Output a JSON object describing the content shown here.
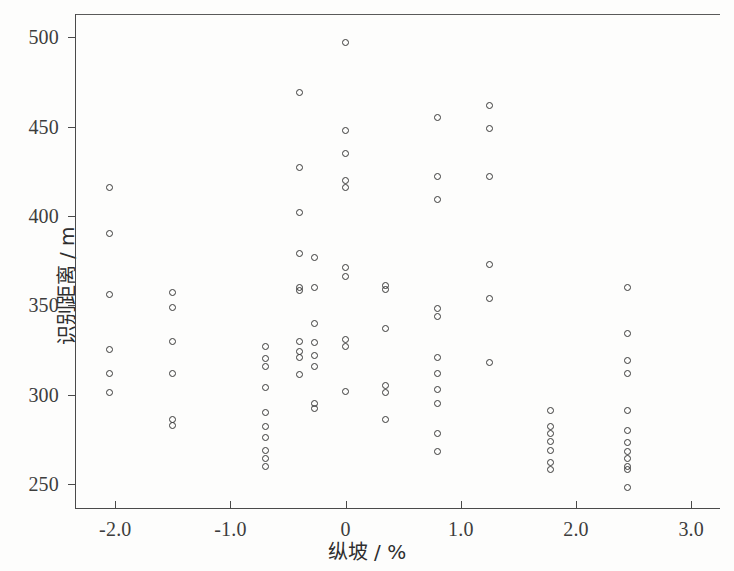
{
  "chart_data": {
    "type": "scatter",
    "title": "",
    "xlabel": "纵坡 / %",
    "ylabel": "识别距离 / m",
    "xlim": [
      -2.35,
      3.25
    ],
    "ylim": [
      236,
      513
    ],
    "grid": false,
    "legend": null,
    "xticks": [
      -2.0,
      -1.0,
      0,
      1.0,
      2.0,
      3.0
    ],
    "xtick_labels": [
      "-2.0",
      "-1.0",
      "0",
      "1.0",
      "2.0",
      "3.0"
    ],
    "yticks": [
      250,
      300,
      350,
      400,
      450,
      500
    ],
    "ytick_labels": [
      "250",
      "300",
      "350",
      "400",
      "450",
      "500"
    ],
    "marker": "open-circle",
    "marker_color": "#3a3a3a",
    "points": [
      [
        -2.05,
        416
      ],
      [
        -2.05,
        390
      ],
      [
        -2.05,
        356
      ],
      [
        -2.05,
        325
      ],
      [
        -2.05,
        312
      ],
      [
        -2.05,
        301
      ],
      [
        -1.5,
        357
      ],
      [
        -1.5,
        349
      ],
      [
        -1.5,
        330
      ],
      [
        -1.5,
        312
      ],
      [
        -1.5,
        286
      ],
      [
        -1.5,
        283
      ],
      [
        -0.7,
        327
      ],
      [
        -0.7,
        320
      ],
      [
        -0.7,
        316
      ],
      [
        -0.7,
        304
      ],
      [
        -0.7,
        290
      ],
      [
        -0.7,
        282
      ],
      [
        -0.7,
        276
      ],
      [
        -0.7,
        269
      ],
      [
        -0.7,
        264
      ],
      [
        -0.7,
        260
      ],
      [
        -0.4,
        469
      ],
      [
        -0.4,
        427
      ],
      [
        -0.4,
        402
      ],
      [
        -0.4,
        379
      ],
      [
        -0.4,
        360
      ],
      [
        -0.4,
        358
      ],
      [
        -0.4,
        330
      ],
      [
        -0.4,
        324
      ],
      [
        -0.4,
        321
      ],
      [
        -0.4,
        311
      ],
      [
        -0.27,
        377
      ],
      [
        -0.27,
        360
      ],
      [
        -0.27,
        340
      ],
      [
        -0.27,
        329
      ],
      [
        -0.27,
        322
      ],
      [
        -0.27,
        316
      ],
      [
        -0.27,
        295
      ],
      [
        -0.27,
        292
      ],
      [
        0.0,
        497
      ],
      [
        0.0,
        448
      ],
      [
        0.0,
        435
      ],
      [
        0.0,
        420
      ],
      [
        0.0,
        416
      ],
      [
        0.0,
        371
      ],
      [
        0.0,
        366
      ],
      [
        0.0,
        331
      ],
      [
        0.0,
        327
      ],
      [
        0.0,
        302
      ],
      [
        0.35,
        361
      ],
      [
        0.35,
        359
      ],
      [
        0.35,
        337
      ],
      [
        0.35,
        305
      ],
      [
        0.35,
        301
      ],
      [
        0.35,
        286
      ],
      [
        0.8,
        455
      ],
      [
        0.8,
        422
      ],
      [
        0.8,
        409
      ],
      [
        0.8,
        348
      ],
      [
        0.8,
        344
      ],
      [
        0.8,
        321
      ],
      [
        0.8,
        312
      ],
      [
        0.8,
        303
      ],
      [
        0.8,
        295
      ],
      [
        0.8,
        278
      ],
      [
        0.8,
        268
      ],
      [
        1.25,
        462
      ],
      [
        1.25,
        449
      ],
      [
        1.25,
        422
      ],
      [
        1.25,
        373
      ],
      [
        1.25,
        354
      ],
      [
        1.25,
        318
      ],
      [
        1.78,
        291
      ],
      [
        1.78,
        282
      ],
      [
        1.78,
        278
      ],
      [
        1.78,
        274
      ],
      [
        1.78,
        269
      ],
      [
        1.78,
        262
      ],
      [
        1.78,
        258
      ],
      [
        2.45,
        360
      ],
      [
        2.45,
        334
      ],
      [
        2.45,
        319
      ],
      [
        2.45,
        312
      ],
      [
        2.45,
        291
      ],
      [
        2.45,
        280
      ],
      [
        2.45,
        273
      ],
      [
        2.45,
        268
      ],
      [
        2.45,
        264
      ],
      [
        2.45,
        260
      ],
      [
        2.45,
        258
      ],
      [
        2.45,
        248
      ]
    ]
  }
}
